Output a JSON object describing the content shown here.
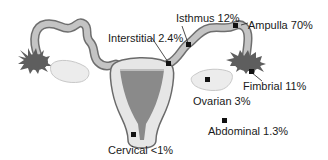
{
  "diagram": {
    "colors": {
      "tube_fill": "#c4c4c4",
      "tube_stroke": "#6e6e6e",
      "uterus_fill": "#e6e6e6",
      "uterus_stroke": "#6a6a6a",
      "cavity_fill": "#8a8a8a",
      "fimbria_fill": "#5e5e5e",
      "ovary_fill": "#ececec",
      "marker": "#111111"
    },
    "labels": {
      "isthmus": "Isthmus 12%",
      "ampulla": "Ampulla 70%",
      "interstitial": "Interstitial 2.4%",
      "fimbrial": "Fimbrial 11%",
      "ovarian": "Ovarian 3%",
      "abdominal": "Abdominal 1.3%",
      "cervical": "Cervical <1%"
    }
  }
}
